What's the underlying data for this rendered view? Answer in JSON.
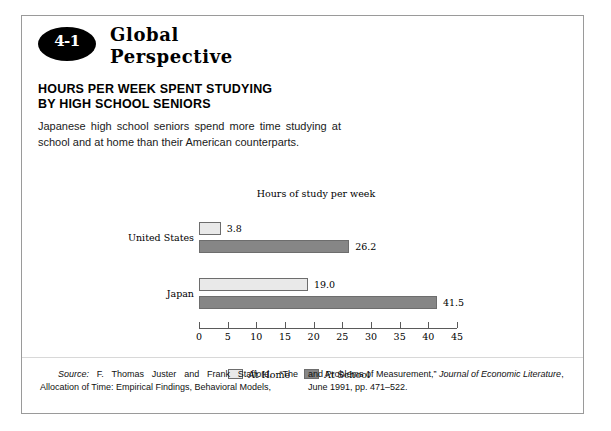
{
  "figure": {
    "badge": "4-1",
    "series_heading_line1": "Global",
    "series_heading_line2": "Perspective",
    "title_line1": "HOURS PER WEEK SPENT STUDYING",
    "title_line2": "BY HIGH SCHOOL SENIORS",
    "description": "Japanese high school seniors spend more time studying at school and at home than their American counterparts."
  },
  "source": {
    "label": "Source:",
    "left_text": " F. Thomas Juster and Frank Stafford, “The Allocation of Time: Empirical Findings, Behavioral Models,",
    "right_text_1": "and Problems of Measurement,” ",
    "right_italic": "Journal of Economic Literature",
    "right_text_2": ", June 1991, pp. 471–522."
  },
  "colors": {
    "at_home": "#e9e9e9",
    "at_school": "#868686",
    "bar_border": "#6d6d6d",
    "frame": "#9a9a9a",
    "badge": "#000000"
  },
  "chart_data": {
    "type": "bar",
    "orientation": "horizontal",
    "title": "Hours of study per week",
    "xlabel": "",
    "ylabel": "",
    "xlim": [
      0,
      45
    ],
    "grid": false,
    "legend_position": "bottom",
    "categories": [
      "United States",
      "Japan"
    ],
    "ticks": [
      0,
      5,
      10,
      15,
      20,
      25,
      30,
      35,
      40,
      45
    ],
    "series": [
      {
        "name": "At Home",
        "values": [
          3.8,
          19.0
        ],
        "labels": [
          "3.8",
          "19.0"
        ],
        "color": "#e9e9e9"
      },
      {
        "name": "At School",
        "values": [
          26.2,
          41.5
        ],
        "labels": [
          "26.2",
          "41.5"
        ],
        "color": "#868686"
      }
    ]
  }
}
